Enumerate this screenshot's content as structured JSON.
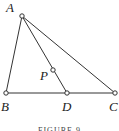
{
  "figure": {
    "caption": "FIGURE 9",
    "points": {
      "A": {
        "label": "A"
      },
      "B": {
        "label": "B"
      },
      "C": {
        "label": "C"
      },
      "D": {
        "label": "D"
      },
      "P": {
        "label": "P"
      }
    },
    "segments": [
      "AB",
      "BC",
      "AC",
      "AD"
    ]
  }
}
